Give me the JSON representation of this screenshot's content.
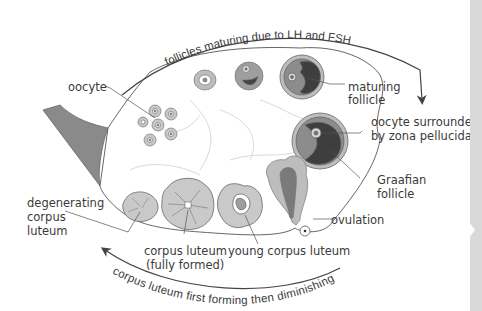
{
  "diagram": {
    "arcs": {
      "top": "follicles maturing due to LH and FSH",
      "bottom": "corpus luteum first forming then diminishing"
    },
    "labels": {
      "oocyte": "oocyte",
      "maturing_follicle_1": "maturing",
      "maturing_follicle_2": "follicle",
      "oocyte_zona_1": "oocyte surrounded",
      "oocyte_zona_2": "by zona pellucida",
      "graafian_1": "Graafian",
      "graafian_2": "follicle",
      "ovulation": "ovulation",
      "young_cl": "young corpus luteum",
      "cl_full_1": "corpus luteum",
      "cl_full_2": "(fully formed)",
      "degen_1": "degenerating",
      "degen_2": "corpus",
      "degen_3": "luteum"
    },
    "colors": {
      "outline": "#555555",
      "fill_light": "#cfcfcf",
      "fill_mid": "#9a9a9a",
      "fill_dark": "#4a4a4a",
      "text": "#3a3a3a"
    }
  }
}
